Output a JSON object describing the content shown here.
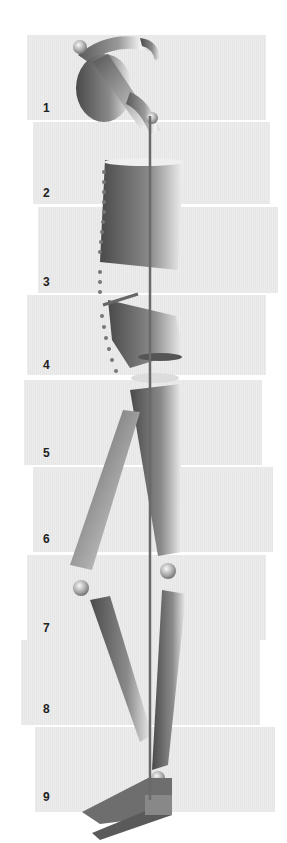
{
  "figure": {
    "segments": [
      {
        "label": "1",
        "top": 35,
        "height": 85,
        "left": 27,
        "right": 266,
        "num_y": 113
      },
      {
        "label": "2",
        "top": 122,
        "height": 82,
        "left": 33,
        "right": 270,
        "num_y": 198
      },
      {
        "label": "3",
        "top": 207,
        "height": 86,
        "left": 38,
        "right": 278,
        "num_y": 287
      },
      {
        "label": "4",
        "top": 295,
        "height": 80,
        "left": 27,
        "right": 266,
        "num_y": 370
      },
      {
        "label": "5",
        "top": 380,
        "height": 85,
        "left": 24,
        "right": 262,
        "num_y": 458
      },
      {
        "label": "6",
        "top": 467,
        "height": 85,
        "left": 33,
        "right": 273,
        "num_y": 544
      },
      {
        "label": "7",
        "top": 555,
        "height": 85,
        "left": 27,
        "right": 266,
        "num_y": 633
      },
      {
        "label": "8",
        "top": 640,
        "height": 85,
        "left": 21,
        "right": 260,
        "num_y": 714
      },
      {
        "label": "9",
        "top": 727,
        "height": 85,
        "left": 35,
        "right": 275,
        "num_y": 802
      }
    ],
    "colors": {
      "band": "#e8e8e8",
      "figure_dark": "#555555",
      "figure_light": "#f2f2f2",
      "rod": "#6a6a6a",
      "label": "#222222"
    }
  }
}
